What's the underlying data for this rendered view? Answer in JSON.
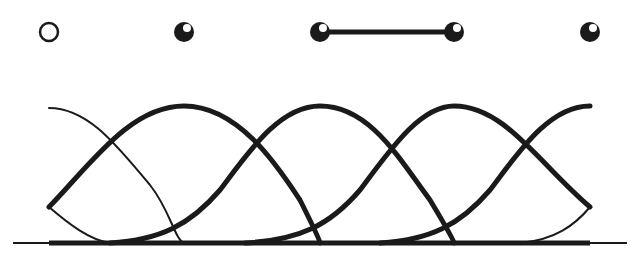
{
  "figure": {
    "knots_x": [
      49,
      184,
      320,
      454,
      590
    ],
    "knot_markers": [
      {
        "type": "open-circle",
        "x": 49
      },
      {
        "type": "filled-ball",
        "x": 184
      },
      {
        "type": "filled-ball",
        "x": 320
      },
      {
        "type": "filled-ball",
        "x": 454
      },
      {
        "type": "filled-ball",
        "x": 590
      }
    ],
    "connected_segment": {
      "from_x": 320,
      "to_x": 454
    },
    "colors": {
      "stroke": "#1a1a1a",
      "background": "#ffffff"
    }
  }
}
